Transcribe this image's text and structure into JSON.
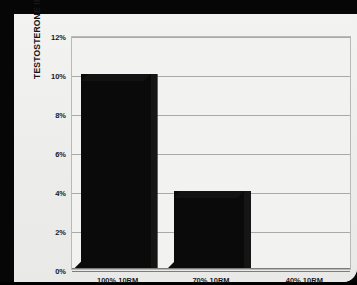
{
  "chart_data": {
    "type": "bar",
    "title": "",
    "subtitle": "",
    "xlabel": "",
    "ylabel": "TESTOSTERONE INCREASE",
    "categories": [
      "100% 10RM",
      "70% 10RM",
      "40% 10RM"
    ],
    "values": [
      10,
      4,
      0
    ],
    "value_unit": "%",
    "ylim": [
      0,
      12
    ],
    "ytick_step": 2,
    "ytick_labels": [
      "0%",
      "2%",
      "4%",
      "6%",
      "8%",
      "10%",
      "12%"
    ],
    "ytick_values": [
      0,
      2,
      4,
      6,
      8,
      10,
      12
    ],
    "grid": true,
    "grid_axis": "y",
    "legend": false,
    "legend_position": "none",
    "series": [
      {
        "name": "Testosterone increase",
        "values": [
          10,
          4,
          0
        ]
      }
    ],
    "bar_style": "3d-black",
    "colors": {
      "bar": "#0a0a0a",
      "bar_top": "#121212",
      "bar_side": "#151515",
      "grid": "#a9a9a7",
      "axis": "#7c7c7a",
      "plot_background": "#f2f2f0",
      "card_background": "#efefed",
      "frame": "#060606",
      "text": "#17171a"
    }
  }
}
